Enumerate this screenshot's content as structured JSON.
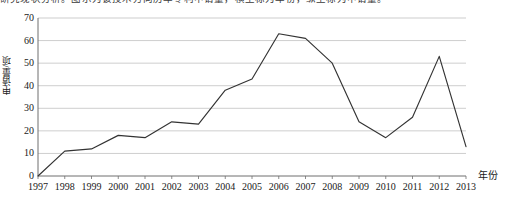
{
  "caption": {
    "text": "研究现状分析。图示为该技术方向历年专利申请量，横坐标为年份，纵坐标为申请量。"
  },
  "chart_data": {
    "type": "line",
    "title": "",
    "xlabel": "年份",
    "ylabel": "申请量/项",
    "categories": [
      "1997",
      "1998",
      "1999",
      "2000",
      "2001",
      "2002",
      "2003",
      "2004",
      "2005",
      "2006",
      "2007",
      "2008",
      "2009",
      "2010",
      "2011",
      "2012",
      "2013"
    ],
    "values": [
      0,
      11,
      12,
      18,
      17,
      24,
      23,
      38,
      43,
      63,
      61,
      50,
      24,
      17,
      26,
      53,
      13
    ],
    "series": [
      {
        "name": "申请量/项",
        "values": [
          0,
          11,
          12,
          18,
          17,
          24,
          23,
          38,
          43,
          63,
          61,
          50,
          24,
          17,
          26,
          53,
          13
        ]
      }
    ],
    "ylim": [
      0,
      70
    ],
    "yticks": [
      0,
      10,
      20,
      30,
      40,
      50,
      60,
      70
    ],
    "ytick_labels": [
      "0",
      "10",
      "20",
      "30",
      "40",
      "50",
      "60",
      "70"
    ],
    "grid": "horizontal",
    "legend": "none",
    "line_color": "#333333",
    "grid_color": "#b8b8b8",
    "axis_color": "#6e6e6e"
  }
}
